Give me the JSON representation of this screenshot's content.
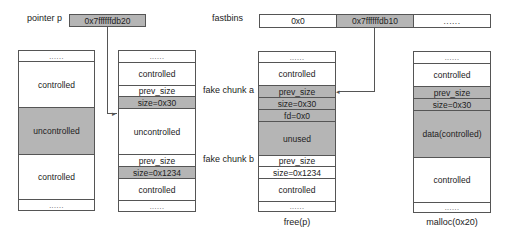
{
  "pointer": {
    "label": "pointer p",
    "value": "0x7ffffffdb20"
  },
  "fastbins": {
    "label": "fastbins",
    "slots": [
      "0x0",
      "0x7ffffffdb10",
      "......"
    ]
  },
  "colors": {
    "shaded": "#b5b5b5",
    "border": "#555555",
    "background": "#ffffff"
  },
  "columns": [
    {
      "caption": "",
      "cells": [
        {
          "text": "......",
          "shaded": false
        },
        {
          "text": "controlled",
          "shaded": false
        },
        {
          "text": "uncontrolled",
          "shaded": true
        },
        {
          "text": "controlled",
          "shaded": false
        },
        {
          "text": "......",
          "shaded": false
        }
      ]
    },
    {
      "caption": "",
      "cells": [
        {
          "text": "......",
          "shaded": false
        },
        {
          "text": "controlled",
          "shaded": false
        },
        {
          "text": "prev_size",
          "shaded": false
        },
        {
          "text": "size=0x30",
          "shaded": true
        },
        {
          "text": "uncontrolled",
          "shaded": false
        },
        {
          "text": "prev_size",
          "shaded": false
        },
        {
          "text": "size=0x1234",
          "shaded": true
        },
        {
          "text": "controlled",
          "shaded": false
        },
        {
          "text": "......",
          "shaded": false
        }
      ]
    },
    {
      "caption": "free(p)",
      "cells": [
        {
          "text": "......",
          "shaded": false
        },
        {
          "text": "controlled",
          "shaded": false
        },
        {
          "text": "prev_size",
          "shaded": true
        },
        {
          "text": "size=0x30",
          "shaded": true
        },
        {
          "text": "fd=0x0",
          "shaded": true
        },
        {
          "text": "unused",
          "shaded": true
        },
        {
          "text": "prev_size",
          "shaded": false
        },
        {
          "text": "size=0x1234",
          "shaded": false
        },
        {
          "text": "controlled",
          "shaded": false
        },
        {
          "text": "......",
          "shaded": false
        }
      ]
    },
    {
      "caption": "malloc(0x20)",
      "cells": [
        {
          "text": "......",
          "shaded": false
        },
        {
          "text": "controlled",
          "shaded": false
        },
        {
          "text": "prev_size",
          "shaded": true
        },
        {
          "text": "size=0x30",
          "shaded": true
        },
        {
          "text": "data(controlled)",
          "shaded": true
        },
        {
          "text": "controlled",
          "shaded": false
        },
        {
          "text": "......",
          "shaded": false
        }
      ]
    }
  ],
  "annotations": {
    "fake_chunk_a": "fake chunk a",
    "fake_chunk_b": "fake chunk b"
  }
}
